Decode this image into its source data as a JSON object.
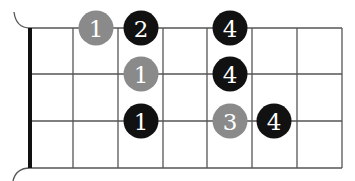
{
  "diagram": {
    "type": "fretboard-fingering",
    "colors": {
      "background": "#ffffff",
      "grid": "#555555",
      "nut": "#111111",
      "black_dot": "#111111",
      "gray_dot": "#8a8a8a",
      "label": "#ffffff"
    },
    "strings_y": [
      28,
      74,
      121,
      168
    ],
    "frets_x": [
      30,
      73,
      118,
      163,
      207,
      252,
      297,
      342
    ],
    "dots": [
      {
        "string": 0,
        "x": 96,
        "label": "1",
        "color": "gray"
      },
      {
        "string": 0,
        "x": 141,
        "label": "2",
        "color": "black"
      },
      {
        "string": 0,
        "x": 230,
        "label": "4",
        "color": "black"
      },
      {
        "string": 1,
        "x": 141,
        "label": "1",
        "color": "gray"
      },
      {
        "string": 1,
        "x": 230,
        "label": "4",
        "color": "black"
      },
      {
        "string": 2,
        "x": 141,
        "label": "1",
        "color": "black"
      },
      {
        "string": 2,
        "x": 230,
        "label": "3",
        "color": "gray"
      },
      {
        "string": 2,
        "x": 274,
        "label": "4",
        "color": "black"
      }
    ]
  }
}
